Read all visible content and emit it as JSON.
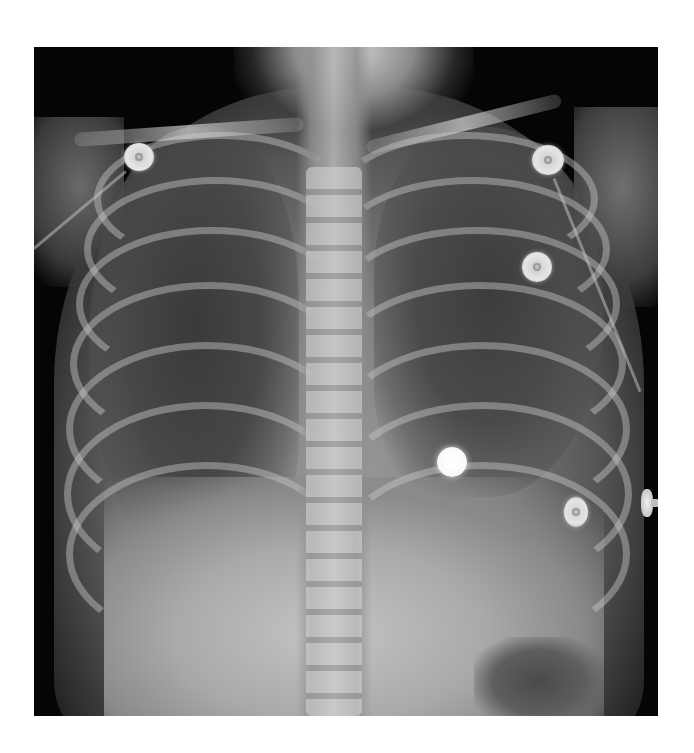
{
  "image": {
    "type": "chest radiograph (frontal view)",
    "alt": "Frontal chest X-ray of a child with ECG electrodes attached",
    "frame": {
      "x": 34,
      "y": 47,
      "width": 624,
      "height": 669
    },
    "background_color": "#ffffff",
    "film_color": "#050505"
  },
  "objects": [
    {
      "name": "ecg-electrode-right-shoulder",
      "x": 105,
      "y": 108,
      "size": 30
    },
    {
      "name": "ecg-electrode-left-shoulder",
      "x": 500,
      "y": 100,
      "size": 32
    },
    {
      "name": "ecg-electrode-left-upper-chest",
      "x": 490,
      "y": 205,
      "size": 30
    },
    {
      "name": "radiopaque-marker-center",
      "x": 404,
      "y": 400,
      "size": 30
    },
    {
      "name": "ecg-electrode-left-lower-chest",
      "x": 530,
      "y": 452,
      "size": 26
    },
    {
      "name": "lead-clip-right-edge",
      "x": 607,
      "y": 442
    }
  ]
}
